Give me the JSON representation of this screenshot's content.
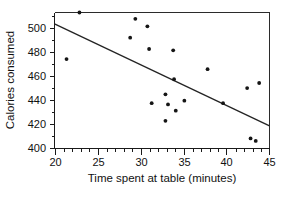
{
  "chart_data": {
    "type": "scatter",
    "title": "",
    "xlabel": "Time spent at table (minutes)",
    "ylabel": "Calories consumed",
    "xlim": [
      20,
      45
    ],
    "ylim": [
      400,
      508
    ],
    "grid": false,
    "legend": null,
    "xticks": [
      20,
      25,
      30,
      35,
      40,
      45
    ],
    "xtick_labels": [
      "20",
      "25",
      "30",
      "35",
      "40",
      "45"
    ],
    "x_minor_tick_step": 1,
    "yticks": [
      400,
      420,
      440,
      460,
      480,
      500
    ],
    "ytick_labels": [
      "400",
      "420",
      "440",
      "460",
      "480",
      "500"
    ],
    "point_color": "#151515",
    "line_color": "#242424",
    "axis_color": "#1a1a1a",
    "points": [
      {
        "x": 21.4,
        "y": 471
      },
      {
        "x": 22.9,
        "y": 508
      },
      {
        "x": 28.8,
        "y": 488
      },
      {
        "x": 29.4,
        "y": 503
      },
      {
        "x": 30.8,
        "y": 497
      },
      {
        "x": 31.0,
        "y": 479
      },
      {
        "x": 31.3,
        "y": 436
      },
      {
        "x": 32.9,
        "y": 443
      },
      {
        "x": 32.9,
        "y": 422
      },
      {
        "x": 33.2,
        "y": 435
      },
      {
        "x": 33.8,
        "y": 478
      },
      {
        "x": 33.9,
        "y": 455
      },
      {
        "x": 34.1,
        "y": 430
      },
      {
        "x": 35.1,
        "y": 438
      },
      {
        "x": 37.8,
        "y": 463
      },
      {
        "x": 39.6,
        "y": 436
      },
      {
        "x": 42.4,
        "y": 448
      },
      {
        "x": 42.8,
        "y": 408
      },
      {
        "x": 43.4,
        "y": 406
      },
      {
        "x": 43.8,
        "y": 452
      }
    ],
    "trendline": {
      "type": "linear-fit",
      "x_start": 20,
      "y_start": 499,
      "x_end": 45,
      "y_end": 418
    }
  },
  "axes": {
    "x_title": "Time spent at table (minutes)",
    "y_title": "Calories consumed"
  },
  "x_labels": {
    "t0": "20",
    "t1": "25",
    "t2": "30",
    "t3": "35",
    "t4": "40",
    "t5": "45"
  },
  "y_labels": {
    "t0": "400",
    "t1": "420",
    "t2": "440",
    "t3": "460",
    "t4": "480",
    "t5": "500"
  }
}
